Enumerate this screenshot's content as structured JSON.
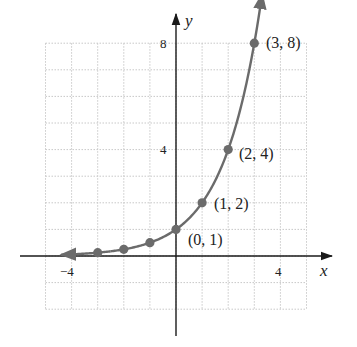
{
  "chart_data": {
    "type": "line",
    "title": "",
    "function": "y = 2^x",
    "xlabel": "x",
    "ylabel": "y",
    "xlim": [
      -5,
      5
    ],
    "ylim": [
      -2,
      8
    ],
    "grid": true,
    "grid_style": "dotted",
    "x_ticks_labeled": [
      {
        "value": -4,
        "label": "−4"
      },
      {
        "value": 4,
        "label": "4"
      }
    ],
    "y_ticks_labeled": [
      {
        "value": 4,
        "label": "4"
      },
      {
        "value": 8,
        "label": "8"
      }
    ],
    "series": [
      {
        "name": "y = 2^x",
        "points": [
          {
            "x": -3,
            "y": 0.125
          },
          {
            "x": -2,
            "y": 0.25
          },
          {
            "x": -1,
            "y": 0.5
          },
          {
            "x": 0,
            "y": 1,
            "label": "(0, 1)"
          },
          {
            "x": 1,
            "y": 2,
            "label": "(1, 2)"
          },
          {
            "x": 2,
            "y": 4,
            "label": "(2, 4)"
          },
          {
            "x": 3,
            "y": 8,
            "label": "(3, 8)"
          }
        ]
      }
    ],
    "annotations": [
      "(0, 1)",
      "(1, 2)",
      "(2, 4)",
      "(3, 8)"
    ],
    "colors": {
      "curve": "#6b6b6b",
      "axes": "#1a1a1a",
      "grid": "#c8c8c8"
    }
  },
  "labels": {
    "x_axis": "x",
    "y_axis": "y",
    "x_tick_neg4": "−4",
    "x_tick_4": "4",
    "y_tick_4": "4",
    "y_tick_8": "8",
    "p01": "(0, 1)",
    "p12": "(1, 2)",
    "p24": "(2, 4)",
    "p38": "(3, 8)"
  }
}
